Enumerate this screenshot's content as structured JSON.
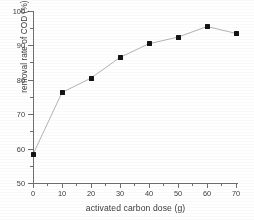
{
  "chart_data": {
    "type": "line",
    "title": "",
    "xlabel": "activated carbon dose (g)",
    "ylabel": "removal rate of COD (%)",
    "x": [
      0,
      10,
      20,
      30,
      40,
      50,
      60,
      70
    ],
    "values": [
      58.3,
      76.3,
      80.5,
      86.5,
      90.5,
      92.4,
      95.5,
      93.5
    ],
    "xlim": [
      0,
      73
    ],
    "ylim": [
      50,
      100
    ],
    "xticks": [
      0,
      10,
      20,
      30,
      40,
      50,
      60,
      70
    ],
    "yticks": [
      50,
      60,
      70,
      80,
      90,
      100
    ],
    "xtick_labels": [
      "0",
      "10",
      "20",
      "30",
      "40",
      "50",
      "60",
      "70"
    ],
    "ytick_labels": [
      "50",
      "60",
      "70",
      "80",
      "90",
      "100"
    ],
    "minor_ticks": true,
    "grid": false,
    "legend": null,
    "marker": "filled-square",
    "marker_color": "#111111",
    "line_color": "#b4b4b4"
  },
  "figure": {
    "axis_color": "#6f6f6f",
    "background": "#ffffff"
  }
}
